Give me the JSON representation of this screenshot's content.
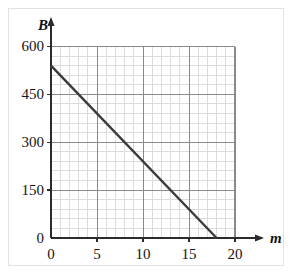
{
  "figure": {
    "background_color": "#ffffff",
    "frame_color": "#e2e2e2",
    "axis_color": "#2b2b2b",
    "major_grid_color": "#8a8a8a",
    "minor_grid_color": "#dcdcdc",
    "line_color": "#3b3b3b"
  },
  "axes": {
    "y_axis_name": "B",
    "x_axis_name": "m"
  },
  "chart_data": {
    "type": "line",
    "title": "",
    "xlabel": "m",
    "ylabel": "B",
    "xlim": [
      0,
      20
    ],
    "ylim": [
      0,
      600
    ],
    "x_ticks": [
      0,
      5,
      10,
      15,
      20
    ],
    "x_tick_labels": [
      "0",
      "5",
      "10",
      "15",
      "20"
    ],
    "y_ticks": [
      0,
      150,
      300,
      450,
      600
    ],
    "y_tick_labels": [
      "0",
      "150",
      "300",
      "450",
      "600"
    ],
    "x_minor_step": 1,
    "y_minor_step": 30,
    "grid": true,
    "legend": "none",
    "series": [
      {
        "name": "B vs m",
        "x": [
          0,
          18
        ],
        "values": [
          540,
          0
        ],
        "slope": -30,
        "intercept": 540,
        "x_intercept": 18
      }
    ],
    "annotations": []
  }
}
